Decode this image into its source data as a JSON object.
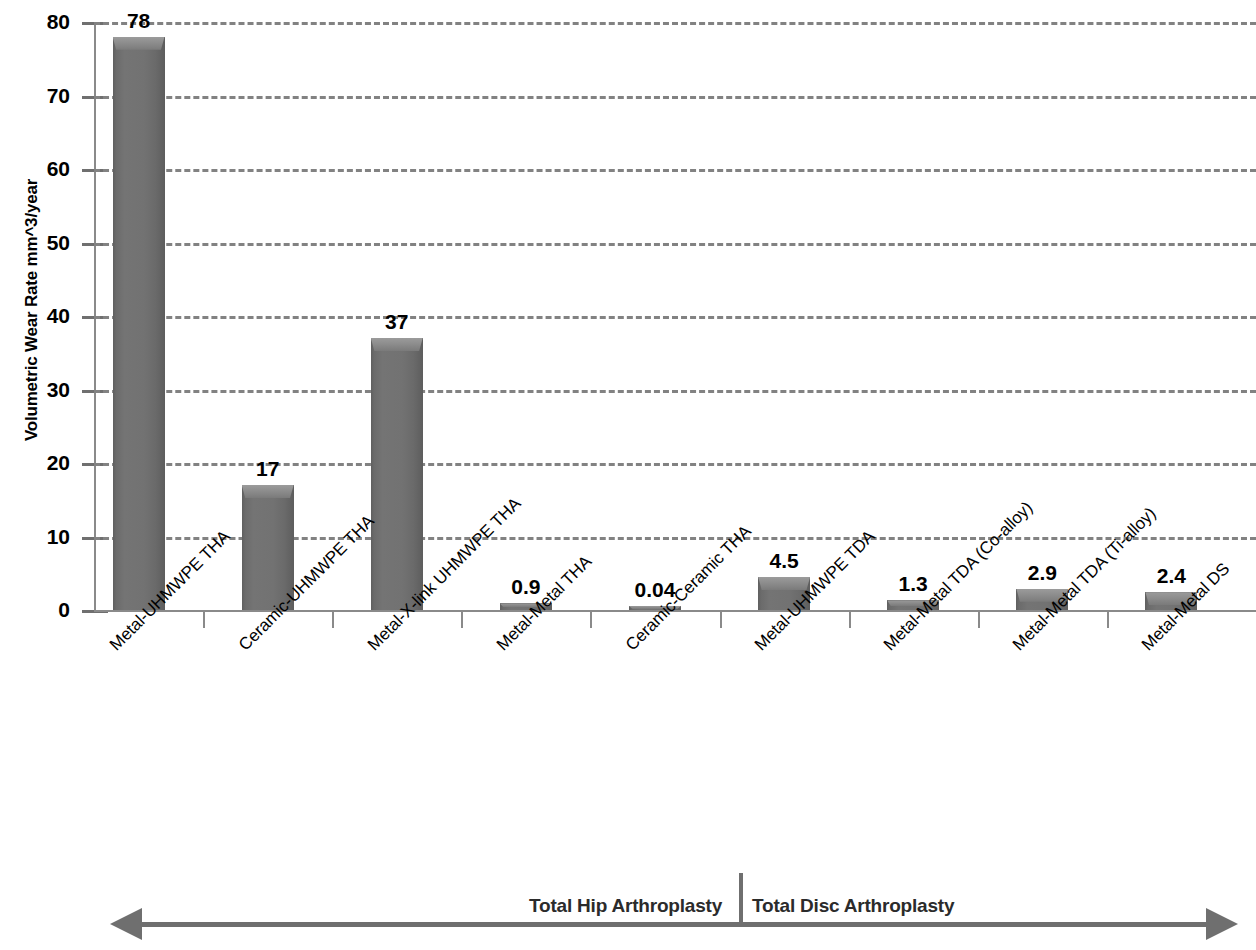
{
  "chart_data": {
    "type": "bar",
    "title": "",
    "xlabel": "",
    "ylabel": "Volumetric Wear Rate mm^3/year",
    "ylim": [
      0,
      80
    ],
    "ytick_values": [
      0,
      10,
      20,
      30,
      40,
      50,
      60,
      70,
      80
    ],
    "ytick_labels": [
      "0",
      "10",
      "20",
      "30",
      "40",
      "50",
      "60",
      "70",
      "80"
    ],
    "grid": true,
    "grid_style": "dashed-horizontal",
    "legend": null,
    "categories": [
      "Metal-UHMWPE THA",
      "Ceramic-UHMWPE THA",
      "Metal-X-link UHMWPE THA",
      "Metal-Metal THA",
      "Ceramic-Ceramic THA",
      "Metal-UHMWPE TDA",
      "Metal-Metal TDA (Co-alloy)",
      "Metal-Metal TDA (Ti-alloy)",
      "Metal-Metal DS"
    ],
    "values": [
      78,
      17,
      37,
      0.9,
      0.04,
      4.5,
      1.3,
      2.9,
      2.4
    ],
    "value_labels": [
      "78",
      "17",
      "37",
      "0.9",
      "0.04",
      "4.5",
      "1.3",
      "2.9",
      "2.4"
    ],
    "bar_color": "#707070",
    "annotations": [
      {
        "text": "Total Hip Arthroplasty",
        "group": "left"
      },
      {
        "text": "Total Disc Arthroplasty",
        "group": "right"
      }
    ]
  },
  "axis": {
    "y_title": "Volumetric Wear Rate mm^3/year",
    "ticks": [
      {
        "label": "80",
        "value": 80
      },
      {
        "label": "70",
        "value": 70
      },
      {
        "label": "60",
        "value": 60
      },
      {
        "label": "50",
        "value": 50
      },
      {
        "label": "40",
        "value": 40
      },
      {
        "label": "30",
        "value": 30
      },
      {
        "label": "20",
        "value": 20
      },
      {
        "label": "10",
        "value": 10
      },
      {
        "label": "0",
        "value": 0
      }
    ]
  },
  "bars": [
    {
      "label": "Metal-UHMWPE THA",
      "value": 78,
      "value_label": "78"
    },
    {
      "label": "Ceramic-UHMWPE THA",
      "value": 17,
      "value_label": "17"
    },
    {
      "label": "Metal-X-link UHMWPE THA",
      "value": 37,
      "value_label": "37"
    },
    {
      "label": "Metal-Metal THA",
      "value": 0.9,
      "value_label": "0.9"
    },
    {
      "label": "Ceramic-Ceramic THA",
      "value": 0.04,
      "value_label": "0.04"
    },
    {
      "label": "Metal-UHMWPE TDA",
      "value": 4.5,
      "value_label": "4.5"
    },
    {
      "label": "Metal-Metal TDA (Co-alloy)",
      "value": 1.3,
      "value_label": "1.3"
    },
    {
      "label": "Metal-Metal TDA (Ti-alloy)",
      "value": 2.9,
      "value_label": "2.9"
    },
    {
      "label": "Metal-Metal DS",
      "value": 2.4,
      "value_label": "2.4"
    }
  ],
  "footer": {
    "left_group": "Total Hip Arthroplasty",
    "right_group": "Total Disc Arthroplasty"
  },
  "colors": {
    "bar": "#707070",
    "grid": "#828282",
    "axis": "#8a8a8a",
    "text": "#000000",
    "annotation": "#6f6f6f"
  }
}
